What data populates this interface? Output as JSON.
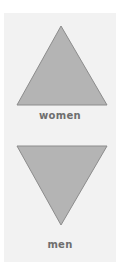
{
  "items": [
    {
      "label": "women",
      "icon": "triangle-up",
      "fill": "#b4b4b4",
      "stroke": "#8c8c8c"
    },
    {
      "label": "men",
      "icon": "triangle-down",
      "fill": "#b4b4b4",
      "stroke": "#8c8c8c"
    }
  ]
}
